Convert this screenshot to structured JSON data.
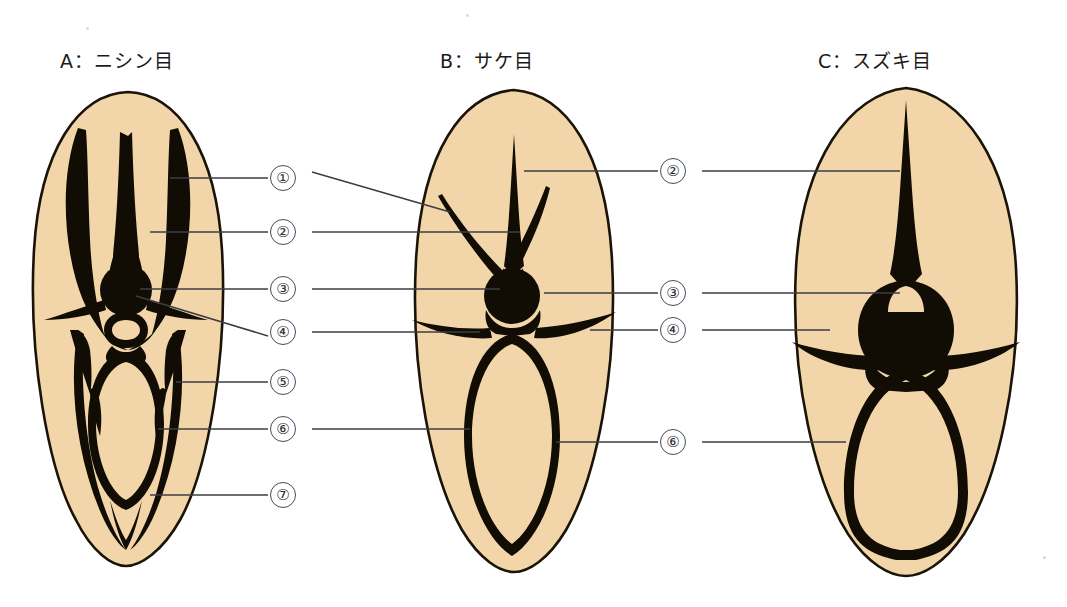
{
  "figure": {
    "background_color": "#ffffff",
    "otolith_fill": "#f2d6a9",
    "otolith_outline": "#1a1408",
    "structure_color": "#110d05",
    "leader_color": "#3c3c44",
    "callout_border_color": "#4a4a52"
  },
  "panels": [
    {
      "id": "A",
      "title": "A：ニシン目"
    },
    {
      "id": "B",
      "title": "B：サケ目"
    },
    {
      "id": "C",
      "title": "C：スズキ目"
    }
  ],
  "callouts": {
    "column_left": [
      {
        "label": "①",
        "number": 1,
        "y": 178
      },
      {
        "label": "②",
        "number": 2,
        "y": 232
      },
      {
        "label": "③",
        "number": 3,
        "y": 289
      },
      {
        "label": "④",
        "number": 4,
        "y": 332
      },
      {
        "label": "⑤",
        "number": 5,
        "y": 382
      },
      {
        "label": "⑥",
        "number": 6,
        "y": 429
      },
      {
        "label": "⑦",
        "number": 7,
        "y": 495
      }
    ],
    "column_right": [
      {
        "label": "②",
        "number": 2,
        "y": 171
      },
      {
        "label": "③",
        "number": 3,
        "y": 293
      },
      {
        "label": "④",
        "number": 4,
        "y": 330
      },
      {
        "label": "⑥",
        "number": 6,
        "y": 442
      }
    ]
  }
}
